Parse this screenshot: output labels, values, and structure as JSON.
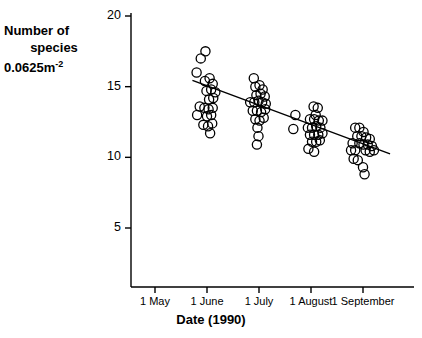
{
  "chart_data": {
    "type": "scatter",
    "title": "",
    "xlabel": "Date (1990)",
    "ylabel": "Number of species 0.0625m-2",
    "ylabel_lines": [
      "Number of",
      "species",
      "0.0625m"
    ],
    "ylabel_superscript": "-2",
    "ylim": [
      0,
      20
    ],
    "ylim_drawn": [
      3.2,
      20.6
    ],
    "yticks": [
      5,
      10,
      15,
      20
    ],
    "ytick_labels": [
      "5",
      "10",
      "15",
      "20"
    ],
    "xticks": [
      0,
      1,
      2,
      3,
      4
    ],
    "xtick_labels": [
      "1 May",
      "1 June",
      "1 July",
      "1 August",
      "1 September"
    ],
    "grid": false,
    "legend": null,
    "marker": "open-circle",
    "marker_radius_px": 4.6,
    "series": [
      {
        "name": "Number of species per 0.0625 m2",
        "points": [
          {
            "x": 0.88,
            "y": 17.0
          },
          {
            "x": 0.97,
            "y": 17.5
          },
          {
            "x": 0.8,
            "y": 16.0
          },
          {
            "x": 0.96,
            "y": 15.4
          },
          {
            "x": 1.05,
            "y": 15.6
          },
          {
            "x": 1.11,
            "y": 15.2
          },
          {
            "x": 0.99,
            "y": 14.7
          },
          {
            "x": 1.08,
            "y": 14.8
          },
          {
            "x": 1.16,
            "y": 14.6
          },
          {
            "x": 1.04,
            "y": 14.1
          },
          {
            "x": 1.12,
            "y": 14.2
          },
          {
            "x": 0.86,
            "y": 13.6
          },
          {
            "x": 0.95,
            "y": 13.5
          },
          {
            "x": 1.03,
            "y": 13.4
          },
          {
            "x": 1.11,
            "y": 13.5
          },
          {
            "x": 0.81,
            "y": 13.0
          },
          {
            "x": 1.0,
            "y": 12.9
          },
          {
            "x": 1.08,
            "y": 13.0
          },
          {
            "x": 0.93,
            "y": 12.3
          },
          {
            "x": 1.02,
            "y": 12.2
          },
          {
            "x": 1.1,
            "y": 12.4
          },
          {
            "x": 1.06,
            "y": 11.7
          },
          {
            "x": 1.9,
            "y": 15.6
          },
          {
            "x": 1.93,
            "y": 15.0
          },
          {
            "x": 2.01,
            "y": 15.1
          },
          {
            "x": 2.07,
            "y": 14.8
          },
          {
            "x": 1.95,
            "y": 14.4
          },
          {
            "x": 2.03,
            "y": 14.5
          },
          {
            "x": 2.11,
            "y": 14.3
          },
          {
            "x": 1.83,
            "y": 13.9
          },
          {
            "x": 1.91,
            "y": 13.9
          },
          {
            "x": 1.99,
            "y": 14.0
          },
          {
            "x": 2.06,
            "y": 13.9
          },
          {
            "x": 2.13,
            "y": 13.8
          },
          {
            "x": 1.88,
            "y": 13.3
          },
          {
            "x": 1.96,
            "y": 13.3
          },
          {
            "x": 2.04,
            "y": 13.2
          },
          {
            "x": 2.12,
            "y": 13.4
          },
          {
            "x": 1.93,
            "y": 12.7
          },
          {
            "x": 2.01,
            "y": 12.6
          },
          {
            "x": 2.09,
            "y": 12.8
          },
          {
            "x": 1.97,
            "y": 12.1
          },
          {
            "x": 1.99,
            "y": 11.5
          },
          {
            "x": 1.96,
            "y": 10.9
          },
          {
            "x": 2.7,
            "y": 13.0
          },
          {
            "x": 2.66,
            "y": 12.0
          },
          {
            "x": 3.05,
            "y": 13.6
          },
          {
            "x": 3.13,
            "y": 13.5
          },
          {
            "x": 3.09,
            "y": 13.0
          },
          {
            "x": 2.98,
            "y": 12.7
          },
          {
            "x": 3.06,
            "y": 12.7
          },
          {
            "x": 3.15,
            "y": 12.6
          },
          {
            "x": 3.22,
            "y": 12.6
          },
          {
            "x": 2.94,
            "y": 12.1
          },
          {
            "x": 3.02,
            "y": 12.1
          },
          {
            "x": 3.1,
            "y": 12.2
          },
          {
            "x": 3.18,
            "y": 12.1
          },
          {
            "x": 2.98,
            "y": 11.6
          },
          {
            "x": 3.06,
            "y": 11.6
          },
          {
            "x": 3.14,
            "y": 11.6
          },
          {
            "x": 3.22,
            "y": 11.7
          },
          {
            "x": 3.02,
            "y": 11.1
          },
          {
            "x": 3.1,
            "y": 11.1
          },
          {
            "x": 3.17,
            "y": 11.2
          },
          {
            "x": 2.95,
            "y": 10.6
          },
          {
            "x": 3.06,
            "y": 10.4
          },
          {
            "x": 3.85,
            "y": 12.1
          },
          {
            "x": 3.93,
            "y": 12.1
          },
          {
            "x": 4.01,
            "y": 11.8
          },
          {
            "x": 3.89,
            "y": 11.5
          },
          {
            "x": 3.97,
            "y": 11.5
          },
          {
            "x": 4.06,
            "y": 11.4
          },
          {
            "x": 4.13,
            "y": 11.3
          },
          {
            "x": 3.8,
            "y": 11.0
          },
          {
            "x": 3.93,
            "y": 11.0
          },
          {
            "x": 4.01,
            "y": 10.9
          },
          {
            "x": 4.09,
            "y": 10.9
          },
          {
            "x": 4.17,
            "y": 10.8
          },
          {
            "x": 3.77,
            "y": 10.5
          },
          {
            "x": 3.85,
            "y": 10.5
          },
          {
            "x": 4.05,
            "y": 10.5
          },
          {
            "x": 4.13,
            "y": 10.4
          },
          {
            "x": 4.21,
            "y": 10.5
          },
          {
            "x": 3.82,
            "y": 9.9
          },
          {
            "x": 3.9,
            "y": 9.8
          },
          {
            "x": 4.0,
            "y": 9.3
          },
          {
            "x": 4.03,
            "y": 8.8
          }
        ]
      }
    ],
    "trendline": {
      "type": "linear-regression",
      "x_start": 0.72,
      "y_start": 15.45,
      "x_end": 4.52,
      "y_end": 10.25
    }
  }
}
